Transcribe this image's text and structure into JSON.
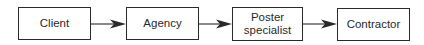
{
  "diagram": {
    "type": "flowchart",
    "direction": "left-to-right",
    "nodes": [
      {
        "id": "client",
        "label": "Client"
      },
      {
        "id": "agency",
        "label": "Agency"
      },
      {
        "id": "poster_specialist",
        "label_line1": "Poster",
        "label_line2": "specialist"
      },
      {
        "id": "contractor",
        "label": "Contractor"
      }
    ],
    "edges": [
      {
        "from": "client",
        "to": "agency"
      },
      {
        "from": "agency",
        "to": "poster_specialist"
      },
      {
        "from": "poster_specialist",
        "to": "contractor"
      }
    ],
    "colors": {
      "stroke": "#2a2a2a",
      "background": "#ffffff",
      "text": "#2a2a2a"
    }
  }
}
